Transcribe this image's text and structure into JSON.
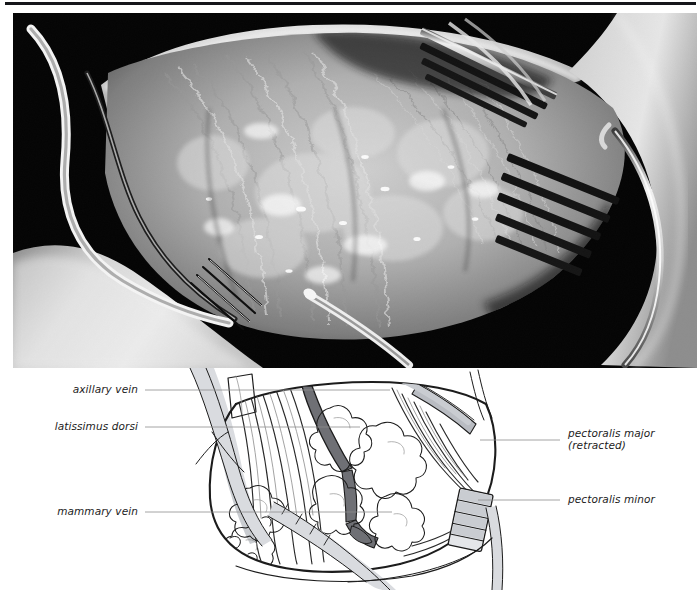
{
  "figure": {
    "kind": "two-panel anatomical figure",
    "panels": [
      {
        "id": "photograph",
        "description": "intraoperative grayscale photograph of an axillary dissection"
      },
      {
        "id": "line-diagram",
        "description": "labeled line drawing keyed to the photograph"
      }
    ]
  },
  "labels": {
    "axillary_vein": "axillary vein",
    "latissimus_dorsi": "latissimus dorsi",
    "mammary_vein": "mammary vein",
    "pectoralis_major_line1": "pectoralis major",
    "pectoralis_major_line2": "(retracted)",
    "pectoralis_minor": "pectoralis minor"
  },
  "colors": {
    "page_background": "#ffffff",
    "rule": "#15161a",
    "photo_background": "#000000",
    "ink": "#1c1c1c",
    "leader_line": "#8e8e8e",
    "vessel_dark_fill": "#6f7075",
    "vessel_light_fill": "#b9bcc2",
    "retractor_fill": "#d7d9dd",
    "tissue_fill": "#ffffff"
  }
}
